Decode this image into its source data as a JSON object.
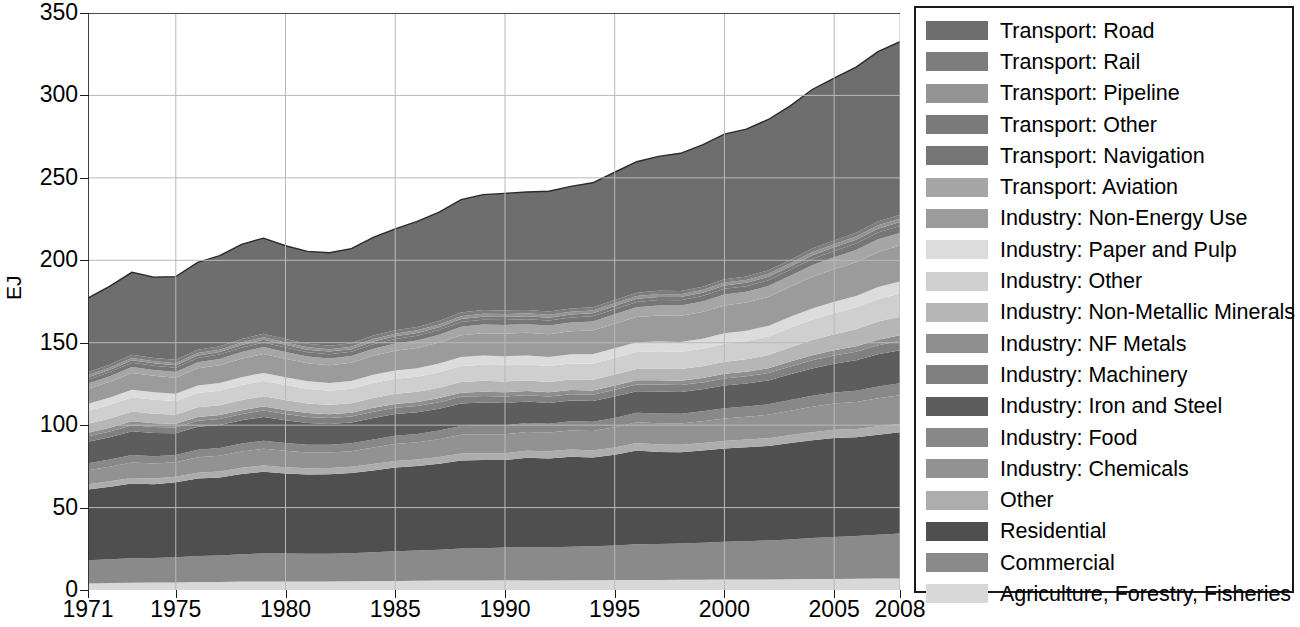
{
  "chart": {
    "type": "area",
    "ylabel": "EJ",
    "xlabel": "",
    "title": ""
  },
  "axes": {
    "y_ticks": [
      "0",
      "50",
      "100",
      "150",
      "200",
      "250",
      "300",
      "350"
    ],
    "x_ticks": [
      "1971",
      "1975",
      "1980",
      "1985",
      "1990",
      "1995",
      "2000",
      "2005",
      "2008"
    ]
  },
  "legend": {
    "items": [
      {
        "label": "Transport: Road",
        "color": "#6e6e6e"
      },
      {
        "label": "Transport: Rail",
        "color": "#7d7d7d"
      },
      {
        "label": "Transport: Pipeline",
        "color": "#949494"
      },
      {
        "label": "Transport: Other",
        "color": "#7a7a7a"
      },
      {
        "label": "Transport: Navigation",
        "color": "#767676"
      },
      {
        "label": "Transport: Aviation",
        "color": "#a6a6a6"
      },
      {
        "label": "Industry: Non-Energy Use",
        "color": "#9b9b9b"
      },
      {
        "label": "Industry: Paper and Pulp",
        "color": "#dcdcdc"
      },
      {
        "label": "Industry: Other",
        "color": "#cfcfcf"
      },
      {
        "label": "Industry: Non-Metallic Minerals",
        "color": "#b6b6b6"
      },
      {
        "label": "Industry: NF Metals",
        "color": "#8e8e8e"
      },
      {
        "label": "Industry: Machinery",
        "color": "#808080"
      },
      {
        "label": "Industry: Iron and Steel",
        "color": "#5d5d5d"
      },
      {
        "label": "Industry: Food",
        "color": "#888888"
      },
      {
        "label": "Industry: Chemicals",
        "color": "#929292"
      },
      {
        "label": "Other",
        "color": "#adadad"
      },
      {
        "label": "Residential",
        "color": "#4f4f4f"
      },
      {
        "label": "Commercial",
        "color": "#8a8a8a"
      },
      {
        "label": "Agriculture, Forestry, Fisheries",
        "color": "#d8d8d8"
      }
    ]
  },
  "chart_data": {
    "type": "area",
    "stacked": true,
    "title": "",
    "xlabel": "",
    "ylabel": "EJ",
    "xlim": [
      1971,
      2008
    ],
    "ylim": [
      0,
      350
    ],
    "grid": "both",
    "legend_position": "right",
    "x": [
      1971,
      1972,
      1973,
      1974,
      1975,
      1976,
      1977,
      1978,
      1979,
      1980,
      1981,
      1982,
      1983,
      1984,
      1985,
      1986,
      1987,
      1988,
      1989,
      1990,
      1991,
      1992,
      1993,
      1994,
      1995,
      1996,
      1997,
      1998,
      1999,
      2000,
      2001,
      2002,
      2003,
      2004,
      2005,
      2006,
      2007,
      2008
    ],
    "series": [
      {
        "name": "Agriculture, Forestry, Fisheries",
        "values": [
          4.0,
          4.2,
          4.4,
          4.5,
          4.6,
          4.8,
          4.9,
          5.1,
          5.2,
          5.2,
          5.2,
          5.2,
          5.3,
          5.4,
          5.5,
          5.6,
          5.7,
          5.8,
          5.8,
          5.9,
          5.8,
          5.8,
          5.9,
          5.9,
          6.0,
          6.1,
          6.1,
          6.2,
          6.2,
          6.3,
          6.3,
          6.4,
          6.5,
          6.6,
          6.7,
          6.8,
          6.9,
          7.0
        ]
      },
      {
        "name": "Commercial",
        "values": [
          14.0,
          14.4,
          14.9,
          14.9,
          15.2,
          15.8,
          16.1,
          16.6,
          17.0,
          16.9,
          16.8,
          16.8,
          17.0,
          17.5,
          18.0,
          18.3,
          18.7,
          19.3,
          19.6,
          19.9,
          20.2,
          20.2,
          20.4,
          20.6,
          21.0,
          21.7,
          21.8,
          22.0,
          22.4,
          23.0,
          23.3,
          23.7,
          24.2,
          24.9,
          25.5,
          26.0,
          26.6,
          27.2
        ]
      },
      {
        "name": "Residential",
        "values": [
          43.0,
          44.0,
          45.3,
          44.8,
          45.5,
          47.0,
          47.3,
          48.7,
          49.5,
          48.6,
          48.0,
          48.2,
          48.6,
          49.6,
          50.8,
          51.3,
          52.2,
          53.5,
          53.4,
          53.0,
          54.2,
          53.8,
          54.6,
          53.8,
          55.0,
          56.8,
          55.8,
          55.4,
          56.0,
          56.5,
          57.0,
          57.3,
          58.5,
          59.3,
          60.0,
          59.8,
          60.7,
          61.5
        ]
      },
      {
        "name": "Other",
        "values": [
          3.2,
          3.3,
          3.4,
          3.4,
          3.4,
          3.5,
          3.6,
          3.7,
          3.8,
          3.8,
          3.8,
          3.8,
          3.8,
          3.9,
          4.0,
          4.0,
          4.1,
          4.2,
          4.2,
          4.2,
          4.3,
          4.3,
          4.3,
          4.3,
          4.4,
          4.5,
          4.5,
          4.5,
          4.6,
          4.6,
          4.7,
          4.7,
          4.8,
          4.9,
          5.0,
          5.0,
          5.1,
          5.2
        ]
      },
      {
        "name": "Industry: Chemicals",
        "values": [
          8.5,
          8.9,
          9.4,
          9.2,
          8.8,
          9.4,
          9.6,
          9.9,
          10.2,
          9.9,
          9.6,
          9.4,
          9.5,
          10.0,
          10.2,
          10.4,
          10.8,
          11.3,
          11.5,
          11.5,
          11.4,
          11.4,
          11.6,
          11.9,
          12.3,
          12.6,
          12.9,
          12.9,
          13.2,
          13.7,
          13.8,
          14.2,
          14.8,
          15.5,
          15.9,
          16.4,
          17.0,
          17.3
        ]
      },
      {
        "name": "Industry: Food",
        "values": [
          4.2,
          4.3,
          4.5,
          4.4,
          4.4,
          4.6,
          4.7,
          4.8,
          4.9,
          4.8,
          4.7,
          4.7,
          4.8,
          4.9,
          5.0,
          5.1,
          5.2,
          5.4,
          5.4,
          5.4,
          5.4,
          5.4,
          5.5,
          5.5,
          5.7,
          5.8,
          5.9,
          5.9,
          6.0,
          6.1,
          6.2,
          6.3,
          6.5,
          6.6,
          6.7,
          6.9,
          7.1,
          7.2
        ]
      },
      {
        "name": "Industry: Iron and Steel",
        "values": [
          13.0,
          13.6,
          14.4,
          14.0,
          13.2,
          13.9,
          13.9,
          14.1,
          14.4,
          13.8,
          13.2,
          12.6,
          12.6,
          13.1,
          13.2,
          13.1,
          13.3,
          13.7,
          13.8,
          13.5,
          13.0,
          12.6,
          12.6,
          12.6,
          13.0,
          13.1,
          13.4,
          13.2,
          13.3,
          13.8,
          13.9,
          14.5,
          15.6,
          16.6,
          17.4,
          18.4,
          19.6,
          20.1
        ]
      },
      {
        "name": "Industry: Machinery",
        "values": [
          3.4,
          3.5,
          3.7,
          3.6,
          3.5,
          3.6,
          3.7,
          3.8,
          3.9,
          3.8,
          3.7,
          3.6,
          3.6,
          3.7,
          3.8,
          3.8,
          3.9,
          4.0,
          4.0,
          4.0,
          3.9,
          3.9,
          3.9,
          3.9,
          4.0,
          4.1,
          4.2,
          4.2,
          4.2,
          4.3,
          4.4,
          4.5,
          4.7,
          4.9,
          5.0,
          5.2,
          5.4,
          5.5
        ]
      },
      {
        "name": "Industry: NF Metals",
        "values": [
          2.1,
          2.2,
          2.3,
          2.3,
          2.2,
          2.3,
          2.3,
          2.4,
          2.4,
          2.4,
          2.3,
          2.3,
          2.3,
          2.4,
          2.4,
          2.4,
          2.5,
          2.5,
          2.6,
          2.6,
          2.5,
          2.5,
          2.5,
          2.5,
          2.6,
          2.6,
          2.7,
          2.7,
          2.7,
          2.8,
          2.8,
          2.9,
          3.0,
          3.1,
          3.2,
          3.3,
          3.4,
          3.5
        ]
      },
      {
        "name": "Industry: Non-Metallic Minerals",
        "values": [
          5.4,
          5.6,
          5.9,
          5.8,
          5.6,
          5.9,
          6.0,
          6.2,
          6.3,
          6.1,
          5.9,
          5.7,
          5.8,
          6.0,
          6.1,
          6.2,
          6.3,
          6.5,
          6.6,
          6.5,
          6.4,
          6.3,
          6.4,
          6.5,
          6.7,
          6.8,
          7.0,
          7.0,
          7.1,
          7.4,
          7.6,
          8.0,
          8.7,
          9.3,
          9.8,
          10.4,
          11.0,
          11.3
        ]
      },
      {
        "name": "Industry: Other",
        "values": [
          8.0,
          8.3,
          8.7,
          8.5,
          8.3,
          8.7,
          8.8,
          9.0,
          9.2,
          9.0,
          8.8,
          8.6,
          8.7,
          9.0,
          9.1,
          9.2,
          9.4,
          9.7,
          9.8,
          9.8,
          9.7,
          9.6,
          9.7,
          9.8,
          10.1,
          10.3,
          10.5,
          10.5,
          10.6,
          10.9,
          11.0,
          11.3,
          11.8,
          12.3,
          12.7,
          13.1,
          13.7,
          14.0
        ]
      },
      {
        "name": "Industry: Paper and Pulp",
        "values": [
          4.2,
          4.4,
          4.6,
          4.5,
          4.4,
          4.6,
          4.7,
          4.8,
          4.9,
          4.8,
          4.7,
          4.7,
          4.8,
          5.0,
          5.1,
          5.1,
          5.3,
          5.4,
          5.5,
          5.5,
          5.5,
          5.5,
          5.6,
          5.7,
          5.8,
          5.9,
          6.0,
          6.0,
          6.1,
          6.3,
          6.3,
          6.4,
          6.6,
          6.8,
          6.9,
          7.1,
          7.3,
          7.4
        ]
      },
      {
        "name": "Industry: Non-Energy Use",
        "values": [
          9.0,
          9.6,
          10.2,
          10.0,
          9.7,
          10.4,
          10.7,
          11.2,
          11.5,
          11.2,
          10.9,
          10.8,
          11.0,
          11.6,
          11.9,
          12.3,
          12.7,
          13.3,
          13.6,
          13.7,
          13.7,
          13.8,
          14.0,
          14.4,
          14.9,
          15.3,
          15.7,
          15.8,
          16.2,
          16.9,
          17.1,
          17.6,
          18.3,
          19.2,
          19.8,
          20.4,
          21.2,
          21.7
        ]
      },
      {
        "name": "Transport: Aviation",
        "values": [
          3.2,
          3.4,
          3.6,
          3.5,
          3.5,
          3.7,
          3.8,
          4.0,
          4.2,
          4.1,
          4.0,
          4.0,
          4.1,
          4.3,
          4.4,
          4.6,
          4.8,
          5.1,
          5.2,
          5.3,
          5.2,
          5.3,
          5.3,
          5.5,
          5.7,
          5.9,
          6.1,
          6.2,
          6.4,
          6.7,
          6.5,
          6.6,
          6.6,
          7.0,
          7.2,
          7.4,
          7.7,
          7.7
        ]
      },
      {
        "name": "Transport: Navigation",
        "values": [
          2.4,
          2.5,
          2.6,
          2.6,
          2.5,
          2.6,
          2.7,
          2.7,
          2.8,
          2.7,
          2.6,
          2.6,
          2.6,
          2.7,
          2.7,
          2.8,
          2.8,
          2.9,
          3.0,
          3.0,
          3.0,
          3.0,
          3.0,
          3.1,
          3.1,
          3.2,
          3.3,
          3.3,
          3.3,
          3.4,
          3.4,
          3.5,
          3.6,
          3.8,
          3.9,
          4.0,
          4.1,
          4.2
        ]
      },
      {
        "name": "Transport: Other",
        "values": [
          1.4,
          1.4,
          1.5,
          1.5,
          1.5,
          1.5,
          1.6,
          1.6,
          1.6,
          1.6,
          1.6,
          1.6,
          1.6,
          1.6,
          1.7,
          1.7,
          1.7,
          1.8,
          1.8,
          1.8,
          1.8,
          1.8,
          1.8,
          1.8,
          1.9,
          1.9,
          1.9,
          1.9,
          2.0,
          2.0,
          2.0,
          2.1,
          2.1,
          2.2,
          2.2,
          2.3,
          2.4,
          2.4
        ]
      },
      {
        "name": "Transport: Pipeline",
        "values": [
          1.2,
          1.3,
          1.3,
          1.3,
          1.3,
          1.4,
          1.4,
          1.5,
          1.5,
          1.5,
          1.5,
          1.5,
          1.5,
          1.6,
          1.6,
          1.6,
          1.7,
          1.7,
          1.8,
          1.8,
          1.8,
          1.7,
          1.7,
          1.7,
          1.7,
          1.7,
          1.7,
          1.7,
          1.7,
          1.8,
          1.8,
          1.8,
          1.8,
          1.9,
          1.9,
          1.9,
          2.0,
          2.0
        ]
      },
      {
        "name": "Transport: Rail",
        "values": [
          1.9,
          1.9,
          2.0,
          2.0,
          2.0,
          2.0,
          2.0,
          2.1,
          2.1,
          2.1,
          2.1,
          2.0,
          2.0,
          2.1,
          2.1,
          2.1,
          2.1,
          2.2,
          2.2,
          2.2,
          2.1,
          2.0,
          2.0,
          2.0,
          2.0,
          2.0,
          2.0,
          2.0,
          2.0,
          2.0,
          2.0,
          2.1,
          2.1,
          2.2,
          2.2,
          2.3,
          2.4,
          2.4
        ]
      },
      {
        "name": "Transport: Road",
        "values": [
          45.0,
          47.5,
          50.0,
          49.0,
          50.5,
          53.0,
          55.0,
          57.5,
          58.0,
          56.5,
          56.0,
          56.5,
          57.5,
          59.5,
          61.5,
          64.0,
          66.0,
          68.5,
          70.0,
          71.0,
          71.5,
          73.0,
          74.0,
          75.5,
          77.5,
          79.5,
          81.5,
          83.5,
          86.0,
          88.0,
          89.5,
          91.5,
          93.5,
          96.5,
          98.5,
          100.5,
          103.0,
          105.0
        ]
      }
    ],
    "totals": [
      177.1,
      184.3,
      192.7,
      190.0,
      190.1,
      198.7,
      202.8,
      209.7,
      213.4,
      208.8,
      205.4,
      204.6,
      207.1,
      215.3,
      219.1,
      223.6,
      229.2,
      236.8,
      240.0,
      240.6,
      242.4,
      242.9,
      246.8,
      249.0,
      256.4,
      263.8,
      266.0,
      266.9,
      272.0,
      280.4,
      283.6,
      289.4,
      299.7,
      313.0,
      320.5,
      327.2,
      338.6,
      345.6
    ]
  }
}
